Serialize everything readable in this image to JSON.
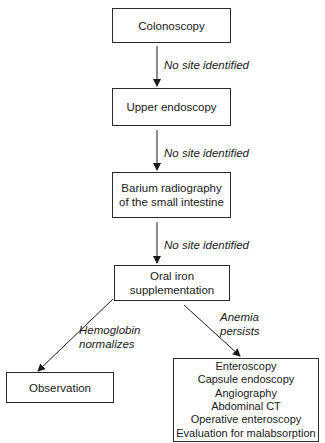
{
  "diagram": {
    "type": "flowchart",
    "nodes": {
      "colonoscopy": "Colonoscopy",
      "upper_endoscopy": "Upper endoscopy",
      "barium": [
        "Barium radiography",
        "of the small intestine"
      ],
      "oral_iron": [
        "Oral iron",
        "supplementation"
      ],
      "observation": "Observation",
      "further_workup": [
        "Enteroscopy",
        "Capsule endoscopy",
        "Angiography",
        "Abdominal CT",
        "Operative enteroscopy",
        "Evaluation for malabsorption"
      ]
    },
    "edges": {
      "colonoscopy_to_upper": "No site identified",
      "upper_to_barium": "No site identified",
      "barium_to_iron": "No site identified",
      "iron_to_observation": [
        "Hemoglobin",
        "normalizes"
      ],
      "iron_to_workup": [
        "Anemia",
        "persists"
      ]
    }
  }
}
